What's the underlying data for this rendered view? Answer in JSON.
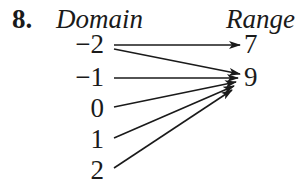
{
  "problem_number": "8.",
  "domain_label": "Domain",
  "range_label": "Range",
  "domain": [
    "−2",
    "−1",
    "0",
    "1",
    "2"
  ],
  "range": [
    "7",
    "9"
  ],
  "mapping": [
    {
      "from": 0,
      "to": 0
    },
    {
      "from": 0,
      "to": 1
    },
    {
      "from": 1,
      "to": 1
    },
    {
      "from": 2,
      "to": 1
    },
    {
      "from": 3,
      "to": 1
    },
    {
      "from": 4,
      "to": 1
    }
  ],
  "colors": {
    "ink": "#1a1a1a",
    "background": "#ffffff"
  }
}
